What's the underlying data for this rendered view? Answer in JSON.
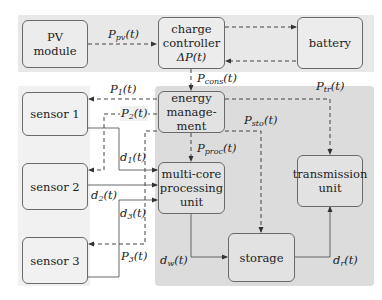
{
  "diagram": {
    "regions": {
      "top_band": {
        "color": "#e8e8e8"
      },
      "embedded_region": {
        "color": "#dcdcdc"
      },
      "sensor_region": {
        "color": "#f1f1f1"
      }
    },
    "nodes": {
      "pv_module": {
        "line1": "PV",
        "line2": "module"
      },
      "charge_controller": {
        "line1": "charge",
        "line2": "controller",
        "line3": "ΔP(t)"
      },
      "battery": {
        "line1": "battery"
      },
      "energy_management": {
        "line1": "energy",
        "line2": "manage-",
        "line3": "ment"
      },
      "sensor1": {
        "line1": "sensor 1"
      },
      "sensor2": {
        "line1": "sensor 2"
      },
      "sensor3": {
        "line1": "sensor 3"
      },
      "processing_unit": {
        "line1": "multi-core",
        "line2": "processing",
        "line3": "unit"
      },
      "transmission_unit": {
        "line1": "transmission",
        "line2": "unit"
      },
      "storage": {
        "line1": "storage"
      }
    },
    "labels": {
      "p_pv": {
        "base": "P",
        "sub": "pv",
        "arg": "(t)"
      },
      "p_cons": {
        "base": "P",
        "sub": "cons",
        "arg": "(t)"
      },
      "p_1": {
        "base": "P",
        "sub": "1",
        "arg": "(t)"
      },
      "p_2": {
        "base": "P",
        "sub": "2",
        "arg": "(t)"
      },
      "p_3": {
        "base": "P",
        "sub": "3",
        "arg": "(t)"
      },
      "p_tr": {
        "base": "P",
        "sub": "tr",
        "arg": "(t)"
      },
      "p_sto": {
        "base": "P",
        "sub": "sto",
        "arg": "(t)"
      },
      "p_proc": {
        "base": "P",
        "sub": "proc",
        "arg": "(t)"
      },
      "d_1": {
        "base": "d",
        "sub": "1",
        "arg": "(t)"
      },
      "d_2": {
        "base": "d",
        "sub": "2",
        "arg": "(t)"
      },
      "d_3": {
        "base": "d",
        "sub": "3",
        "arg": "(t)"
      },
      "d_w": {
        "base": "d",
        "sub": "w",
        "arg": "(t)"
      },
      "d_r": {
        "base": "d",
        "sub": "r",
        "arg": "(t)"
      }
    },
    "legend_semantics": {
      "dashed": "power flow",
      "solid": "data flow"
    }
  }
}
